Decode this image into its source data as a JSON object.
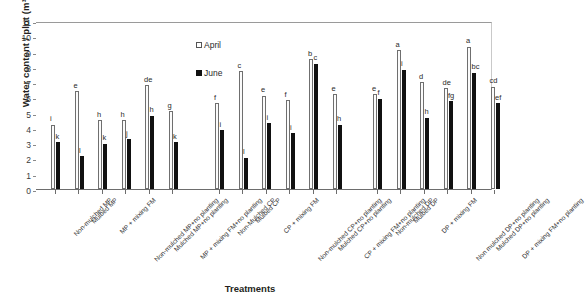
{
  "chart_data": {
    "type": "bar",
    "title": "",
    "xlabel": "Treatments",
    "ylabel": "Water content / plot (m³)",
    "ylim": [
      0,
      11
    ],
    "ytick_values": [
      0,
      1,
      2,
      3,
      4,
      5,
      6,
      7,
      8,
      9,
      10,
      11
    ],
    "grid": false,
    "legend_position": "top-center",
    "legend": [
      "April",
      "June"
    ],
    "series": [
      {
        "name": "April",
        "values": [
          4.2,
          6.4,
          4.5,
          4.5,
          6.8,
          5.1,
          5.6,
          7.7,
          6.1,
          5.8,
          8.5,
          6.2,
          6.2,
          9.1,
          7.0,
          6.6,
          9.3,
          6.7
        ]
      },
      {
        "name": "June",
        "values": [
          3.05,
          2.15,
          2.95,
          3.25,
          4.8,
          3.05,
          3.85,
          2.05,
          4.3,
          3.65,
          8.2,
          4.2,
          5.9,
          7.8,
          4.65,
          5.75,
          7.6,
          5.6
        ]
      }
    ],
    "categories": [
      "Non-mulched MP",
      "Mulbed MP",
      "MP + mixing FM",
      "Non-mulched MP+no planting",
      "Mulched MP+no planting",
      "MP + mixing FM+no planting",
      "Non-Mulched CP",
      "Mulbed CP",
      "CP + mixing FM",
      "Non-mulched CP+no planting",
      "Mulched CP+no planting",
      "CP + mixing FM+no planting",
      "Non-mulched DP",
      "Mulbed DP",
      "DP + mixing FM",
      "Non mulched DP+no planting",
      "Mulched DP+no planting",
      "DP + mixing FM+no planting"
    ],
    "annotations_april": [
      "i",
      "e",
      "h",
      "h",
      "de",
      "g",
      "f",
      "c",
      "e",
      "f",
      "b",
      "e",
      "e",
      "a",
      "d",
      "de",
      "a",
      "cd"
    ],
    "annotations_june": [
      "k",
      "l",
      "k",
      "j",
      "h",
      "k",
      "i",
      "l",
      "i",
      "i",
      "c",
      "h",
      "f",
      "i",
      "h",
      "fg",
      "bc",
      "ef"
    ],
    "groups": [
      {
        "name": "MP",
        "start": 0,
        "count": 6
      },
      {
        "name": "CP",
        "start": 6,
        "count": 6
      },
      {
        "name": "DP",
        "start": 12,
        "count": 6
      }
    ]
  }
}
